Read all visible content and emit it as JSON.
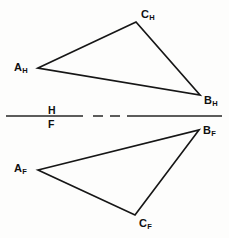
{
  "diagram": {
    "kind": "orthographic-projection",
    "background_color": "#fdfdfc",
    "line_color": "#161616",
    "canvas": {
      "width": 229,
      "height": 238
    },
    "fold_line": {
      "name": "H-F folding line",
      "y": 116,
      "x_start": 6,
      "x_end": 222,
      "upper_label": "H",
      "lower_label": "F",
      "label_x": 48,
      "upper_label_y": 105,
      "lower_label_y": 119,
      "segments": [
        {
          "x1": 6,
          "x2": 83
        },
        {
          "x1": 93,
          "x2": 103
        },
        {
          "x1": 110,
          "x2": 120
        },
        {
          "x1": 127,
          "x2": 222
        }
      ]
    },
    "views": [
      {
        "name": "horizontal-view",
        "view_label": "H",
        "polygon": "38,68 136,22 200,95",
        "vertices": [
          {
            "id": "A_H",
            "letter": "A",
            "sub": "H",
            "x": 38,
            "y": 68,
            "label_x": 14,
            "label_y": 62
          },
          {
            "id": "C_H",
            "letter": "C",
            "sub": "H",
            "x": 136,
            "y": 22,
            "label_x": 141,
            "label_y": 9
          },
          {
            "id": "B_H",
            "letter": "B",
            "sub": "H",
            "x": 200,
            "y": 95,
            "label_x": 204,
            "label_y": 95
          }
        ]
      },
      {
        "name": "frontal-view",
        "view_label": "F",
        "polygon": "38,170 199,130 135,215",
        "vertices": [
          {
            "id": "A_F",
            "letter": "A",
            "sub": "F",
            "x": 38,
            "y": 170,
            "label_x": 14,
            "label_y": 163
          },
          {
            "id": "B_F",
            "letter": "B",
            "sub": "F",
            "x": 199,
            "y": 130,
            "label_x": 203,
            "label_y": 125
          },
          {
            "id": "C_F",
            "letter": "C",
            "sub": "F",
            "x": 135,
            "y": 215,
            "label_x": 139,
            "label_y": 218
          }
        ]
      }
    ]
  }
}
